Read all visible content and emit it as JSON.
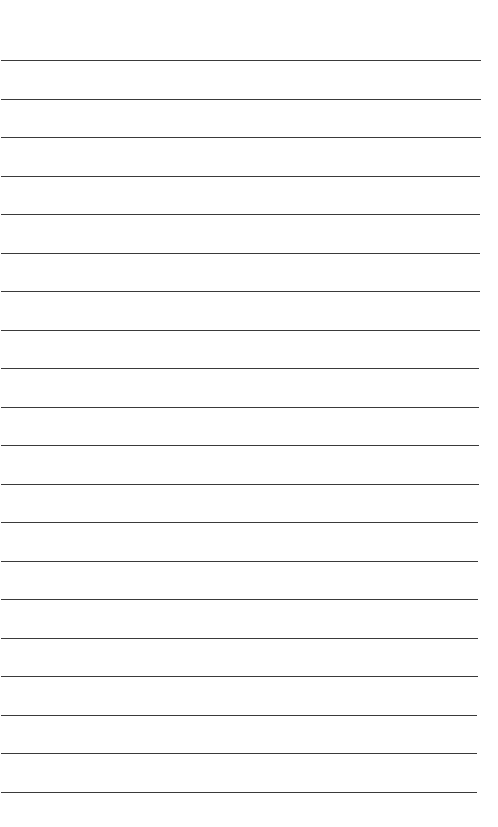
{
  "page": {
    "type": "lined-paper",
    "line_count": 20,
    "first_line_y": 60,
    "line_spacing": 38.5,
    "line_color": "#3a3a3a",
    "background": "#ffffff",
    "line_left": 1,
    "line_right_top": 481,
    "line_right_bottom": 477
  }
}
